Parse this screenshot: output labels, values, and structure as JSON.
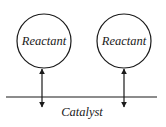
{
  "diagram": {
    "reactants": [
      {
        "label": "Reactant",
        "cx": 44,
        "cy": 41,
        "r": 27,
        "arrow_x": 42
      },
      {
        "label": "Reactant",
        "cx": 124,
        "cy": 41,
        "r": 27,
        "arrow_x": 124
      }
    ],
    "catalyst": {
      "label": "Catalyst",
      "line_y": 97,
      "x1": 6,
      "x2": 157
    },
    "colors": {
      "stroke": "#1a1a1a",
      "background": "#ffffff"
    }
  }
}
